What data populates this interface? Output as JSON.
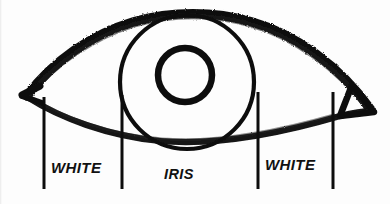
{
  "diagram": {
    "style": "hand-drawn charcoal sketch",
    "background_color": "#fdfdfd",
    "ink_color": "#111111"
  },
  "labels": [
    {
      "id": "white-left",
      "text": "WHITE",
      "x": 51,
      "y": 160
    },
    {
      "id": "iris",
      "text": "IRIS",
      "x": 164,
      "y": 167
    },
    {
      "id": "white-right",
      "text": "WHITE",
      "x": 265,
      "y": 157
    }
  ],
  "leader_lines": [
    {
      "id": "leader-1",
      "x": 44,
      "y_top": 97,
      "y_bottom": 189
    },
    {
      "id": "leader-2",
      "x": 122,
      "y_top": 95,
      "y_bottom": 189
    },
    {
      "id": "leader-3",
      "x": 258,
      "y_top": 92,
      "y_bottom": 189
    },
    {
      "id": "leader-4",
      "x": 333,
      "y_top": 92,
      "y_bottom": 189
    }
  ],
  "parts": {
    "upper_lid": {
      "name": "upper eyelid",
      "stroke_width": 9
    },
    "lower_lid": {
      "name": "lower eyelid",
      "stroke_width": 6
    },
    "iris": {
      "name": "iris",
      "cx": 187,
      "cy": 82,
      "r": 67,
      "stroke_width": 4
    },
    "pupil": {
      "name": "pupil",
      "cx": 185,
      "cy": 75,
      "r": 27,
      "stroke_width": 6
    },
    "inner_canthus": {
      "name": "tear duct corner",
      "x": 370,
      "y": 112
    },
    "outer_canthus": {
      "name": "outer eye corner",
      "x": 26,
      "y": 95
    }
  }
}
